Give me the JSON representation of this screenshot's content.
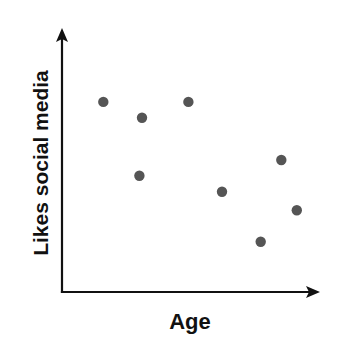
{
  "chart_data": {
    "type": "scatter",
    "title": "",
    "xlabel": "Age",
    "ylabel": "Likes social media",
    "xlim": [
      0,
      100
    ],
    "ylim": [
      0,
      100
    ],
    "grid": false,
    "legend": null,
    "ticks": {
      "x": [],
      "y": []
    },
    "series": [
      {
        "name": "points",
        "color": "#555555",
        "points": [
          {
            "x": 16,
            "y": 72
          },
          {
            "x": 31,
            "y": 66
          },
          {
            "x": 49,
            "y": 72
          },
          {
            "x": 30,
            "y": 44
          },
          {
            "x": 62,
            "y": 38
          },
          {
            "x": 85,
            "y": 50
          },
          {
            "x": 77,
            "y": 19
          },
          {
            "x": 91,
            "y": 31
          }
        ]
      }
    ]
  },
  "style": {
    "axis_color": "#111111",
    "point_color": "#555555",
    "background": "#ffffff"
  },
  "layout": {
    "origin": [
      62,
      292
    ],
    "x_end": 320,
    "y_top": 28,
    "plot_x_max": 320,
    "plot_y_min": 28,
    "point_radius": 5.2
  }
}
